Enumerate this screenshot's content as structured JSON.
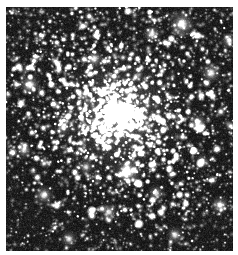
{
  "page": {
    "background_color": "#ffffff",
    "width": 238,
    "height": 255
  },
  "image_plate": {
    "name": "globular-cluster-photograph",
    "kind": "astronomical-image",
    "color_mode": "grayscale",
    "x": 6,
    "y": 7,
    "width": 227,
    "height": 244,
    "background_color": "#151515",
    "noise_floor_color": "#1e1e1e",
    "star_color": "#ffffff",
    "halo_color": "#b4b4b4",
    "description": "Dense monochrome star field containing a bright centrally concentrated globular cluster",
    "alt_text": "Globular star cluster: thousands of white point-like stars on a near-black sky, concentrated into a bright unresolved core near the image centre and thinning toward the corners"
  },
  "chart_data": {
    "type": "scatter",
    "title": "",
    "xlabel": "",
    "ylabel": "",
    "grid": false,
    "legend_position": "none",
    "xlim": [
      0,
      227
    ],
    "ylim": [
      0,
      244
    ],
    "background": "#151515",
    "point_color": "#ffffff",
    "cluster": {
      "center_x": 112,
      "center_y": 108,
      "core_radius": 26,
      "halo_radius": 58,
      "core_peak_brightness": 0.96,
      "total_stars_estimate": 4200
    },
    "field_stars_estimate": 2600,
    "bright_stars": [
      {
        "x": 176,
        "y": 17,
        "r": 3.0,
        "brightness": 1.0
      },
      {
        "x": 122,
        "y": 165,
        "r": 3.2,
        "brightness": 1.0
      },
      {
        "x": 24,
        "y": 78,
        "r": 2.6,
        "brightness": 0.95
      },
      {
        "x": 205,
        "y": 66,
        "r": 2.4,
        "brightness": 0.93
      },
      {
        "x": 146,
        "y": 27,
        "r": 2.2,
        "brightness": 0.9
      },
      {
        "x": 88,
        "y": 52,
        "r": 2.1,
        "brightness": 0.9
      },
      {
        "x": 192,
        "y": 116,
        "r": 2.2,
        "brightness": 0.88
      },
      {
        "x": 38,
        "y": 188,
        "r": 2.3,
        "brightness": 0.9
      },
      {
        "x": 214,
        "y": 198,
        "r": 2.2,
        "brightness": 0.88
      },
      {
        "x": 63,
        "y": 232,
        "r": 2.0,
        "brightness": 0.86
      },
      {
        "x": 169,
        "y": 228,
        "r": 2.1,
        "brightness": 0.86
      },
      {
        "x": 18,
        "y": 143,
        "r": 2.0,
        "brightness": 0.84
      },
      {
        "x": 103,
        "y": 205,
        "r": 2.0,
        "brightness": 0.84
      },
      {
        "x": 223,
        "y": 34,
        "r": 1.9,
        "brightness": 0.82
      },
      {
        "x": 57,
        "y": 120,
        "r": 1.9,
        "brightness": 0.82
      },
      {
        "x": 150,
        "y": 186,
        "r": 2.0,
        "brightness": 0.84
      },
      {
        "x": 80,
        "y": 160,
        "r": 1.8,
        "brightness": 0.8
      },
      {
        "x": 196,
        "y": 154,
        "r": 1.8,
        "brightness": 0.8
      }
    ]
  }
}
